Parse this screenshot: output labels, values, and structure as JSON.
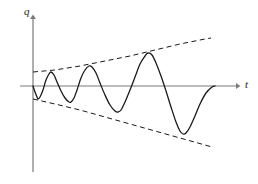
{
  "figure": {
    "kind": "line-plot",
    "background_color": "#ffffff",
    "width": 258,
    "height": 184,
    "axes": {
      "vertical": {
        "label": "q",
        "label_x": 24,
        "label_y": 6,
        "x": 33,
        "y_top": 15,
        "y_bottom": 172,
        "arrow": true,
        "color": "#7a7a7a"
      },
      "horizontal": {
        "label": "t",
        "label_x": 245,
        "label_y": 79,
        "y": 86,
        "x_left": 20,
        "x_right": 241,
        "arrow": true,
        "color": "#7a7a7a"
      }
    }
  },
  "chart_data": {
    "type": "line",
    "title": "",
    "xlabel": "t",
    "ylabel": "q",
    "grid": false,
    "legend": null,
    "xlim": [
      0,
      258
    ],
    "ylim": [
      0,
      184
    ],
    "series": [
      {
        "name": "oscillation",
        "style": "solid",
        "color": "#1a1a1a",
        "line_width": 1.3,
        "points_px": [
          [
            33,
            86
          ],
          [
            35,
            92
          ],
          [
            37,
            97
          ],
          [
            38,
            99
          ],
          [
            40,
            97
          ],
          [
            43,
            90
          ],
          [
            46,
            80
          ],
          [
            49,
            74
          ],
          [
            51,
            72
          ],
          [
            54,
            75
          ],
          [
            57,
            82
          ],
          [
            61,
            91
          ],
          [
            65,
            98
          ],
          [
            69,
            102
          ],
          [
            71,
            102
          ],
          [
            74,
            98
          ],
          [
            77,
            90
          ],
          [
            81,
            78
          ],
          [
            85,
            70
          ],
          [
            89,
            66
          ],
          [
            92,
            67
          ],
          [
            96,
            73
          ],
          [
            100,
            83
          ],
          [
            105,
            95
          ],
          [
            110,
            105
          ],
          [
            115,
            111
          ],
          [
            118,
            112
          ],
          [
            121,
            110
          ],
          [
            125,
            102
          ],
          [
            130,
            90
          ],
          [
            135,
            77
          ],
          [
            140,
            64
          ],
          [
            145,
            56
          ],
          [
            148,
            53
          ],
          [
            152,
            55
          ],
          [
            156,
            63
          ],
          [
            161,
            76
          ],
          [
            166,
            91
          ],
          [
            171,
            107
          ],
          [
            176,
            122
          ],
          [
            180,
            131
          ],
          [
            183,
            134
          ],
          [
            186,
            133
          ],
          [
            190,
            127
          ],
          [
            195,
            116
          ],
          [
            200,
            104
          ],
          [
            206,
            93
          ],
          [
            212,
            87
          ],
          [
            215,
            86
          ]
        ]
      },
      {
        "name": "upper-envelope",
        "style": "dashed",
        "color": "#1a1a1a",
        "line_width": 1.0,
        "points_px": [
          [
            33,
            72
          ],
          [
            55,
            70
          ],
          [
            80,
            66
          ],
          [
            105,
            61
          ],
          [
            130,
            56
          ],
          [
            155,
            50
          ],
          [
            180,
            44
          ],
          [
            205,
            39
          ],
          [
            211,
            38
          ]
        ]
      },
      {
        "name": "lower-envelope",
        "style": "dashed",
        "color": "#1a1a1a",
        "line_width": 1.0,
        "points_px": [
          [
            33,
            99
          ],
          [
            55,
            104
          ],
          [
            80,
            110
          ],
          [
            105,
            117
          ],
          [
            130,
            124
          ],
          [
            155,
            131
          ],
          [
            180,
            138
          ],
          [
            205,
            145
          ],
          [
            212,
            147
          ]
        ]
      }
    ],
    "annotations": [
      {
        "text": "q",
        "x": 24,
        "y": 6,
        "role": "y-axis-label"
      },
      {
        "text": "t",
        "x": 245,
        "y": 79,
        "role": "x-axis-label"
      }
    ]
  }
}
